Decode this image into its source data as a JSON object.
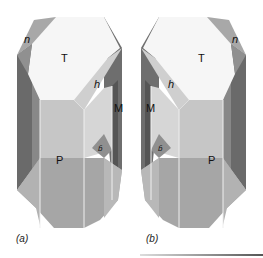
{
  "figure": {
    "type": "crystal-habit-drawings",
    "crystals": [
      {
        "id": "a",
        "caption": "(a)",
        "faces": {
          "top": "T",
          "upper_left": "n",
          "upper_right": "h",
          "side": "M",
          "lower": "P",
          "small": "b̄"
        }
      },
      {
        "id": "b",
        "caption": "(b)",
        "faces": {
          "top": "T",
          "upper_right": "n",
          "upper_left": "h",
          "side": "M",
          "lower": "P",
          "small": "b̄"
        }
      }
    ]
  },
  "colors": {
    "top_face": "#f6f6f6",
    "light_face": "#d6d6d6",
    "mid_face": "#b4b4b4",
    "dark_face": "#7c7c7c",
    "darker_face": "#5e5e5e",
    "lower_face": "#a6a6a6",
    "edge": "#efefef"
  }
}
